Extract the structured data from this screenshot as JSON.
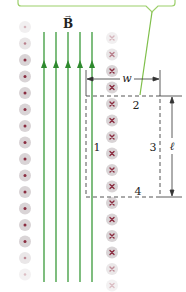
{
  "diagram": {
    "field_label": "B",
    "field_label_vector": "→",
    "width_label": "w",
    "length_label": "ℓ",
    "side_labels": [
      "1",
      "2",
      "3",
      "4"
    ],
    "colors": {
      "field_line": "#3a9a3a",
      "callout_border": "#9ccf6a",
      "dot_center": "#8a2c40",
      "circle_fill": "#d9d4d6",
      "circle_ring": "#e9e6e7",
      "dashed": "#555555",
      "dimension": "#333333"
    },
    "left_column": {
      "symbol": "dot",
      "meaning": "out of page",
      "count": 16
    },
    "right_column": {
      "symbol": "cross",
      "meaning": "into page",
      "count": 16
    },
    "field_lines": {
      "count": 5,
      "direction": "up"
    }
  }
}
